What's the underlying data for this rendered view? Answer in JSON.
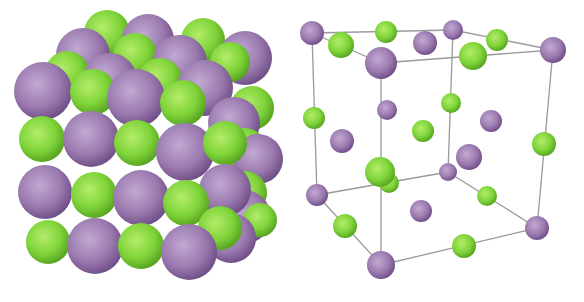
{
  "figure": {
    "panels": [
      {
        "id": "space-filling",
        "description": "Space-filling model of NaCl lattice"
      },
      {
        "id": "unit-cell",
        "description": "Ball-and-stick face-centered cubic unit cell"
      }
    ]
  },
  "colors": {
    "large_ion": "#9b7bb0",
    "large_ion_highlight": "#c2a9d2",
    "large_ion_shadow": "#6d4d85",
    "small_ion": "#7fd43a",
    "small_ion_highlight": "#b4ec6a",
    "small_ion_shadow": "#55a21f",
    "bond_line": "#9a9a9a",
    "background": "#ffffff"
  },
  "left_spheres": [
    {
      "x": 107,
      "y": 33,
      "r": 23,
      "c": "g"
    },
    {
      "x": 148,
      "y": 40,
      "r": 26,
      "c": "p"
    },
    {
      "x": 203,
      "y": 40,
      "r": 22,
      "c": "g"
    },
    {
      "x": 245,
      "y": 58,
      "r": 27,
      "c": "p"
    },
    {
      "x": 83,
      "y": 55,
      "r": 27,
      "c": "p"
    },
    {
      "x": 135,
      "y": 55,
      "r": 22,
      "c": "g"
    },
    {
      "x": 180,
      "y": 62,
      "r": 27,
      "c": "p"
    },
    {
      "x": 230,
      "y": 62,
      "r": 20,
      "c": "g"
    },
    {
      "x": 67,
      "y": 73,
      "r": 22,
      "c": "g"
    },
    {
      "x": 110,
      "y": 80,
      "r": 27,
      "c": "p"
    },
    {
      "x": 160,
      "y": 80,
      "r": 22,
      "c": "g"
    },
    {
      "x": 205,
      "y": 88,
      "r": 28,
      "c": "p"
    },
    {
      "x": 252,
      "y": 108,
      "r": 22,
      "c": "g"
    },
    {
      "x": 43,
      "y": 91,
      "r": 29,
      "c": "p"
    },
    {
      "x": 93,
      "y": 92,
      "r": 23,
      "c": "g"
    },
    {
      "x": 136,
      "y": 98,
      "r": 29,
      "c": "p"
    },
    {
      "x": 183,
      "y": 103,
      "r": 23,
      "c": "g"
    },
    {
      "x": 234,
      "y": 123,
      "r": 26,
      "c": "p"
    },
    {
      "x": 245,
      "y": 150,
      "r": 22,
      "c": "g"
    },
    {
      "x": 258,
      "y": 159,
      "r": 25,
      "c": "p"
    },
    {
      "x": 42,
      "y": 139,
      "r": 23,
      "c": "g"
    },
    {
      "x": 91,
      "y": 139,
      "r": 28,
      "c": "p"
    },
    {
      "x": 137,
      "y": 143,
      "r": 23,
      "c": "g"
    },
    {
      "x": 185,
      "y": 152,
      "r": 29,
      "c": "p"
    },
    {
      "x": 225,
      "y": 143,
      "r": 22,
      "c": "g"
    },
    {
      "x": 245,
      "y": 193,
      "r": 22,
      "c": "g"
    },
    {
      "x": 244,
      "y": 217,
      "r": 27,
      "c": "p"
    },
    {
      "x": 225,
      "y": 190,
      "r": 26,
      "c": "p"
    },
    {
      "x": 45,
      "y": 192,
      "r": 27,
      "c": "p"
    },
    {
      "x": 94,
      "y": 195,
      "r": 23,
      "c": "g"
    },
    {
      "x": 141,
      "y": 198,
      "r": 28,
      "c": "p"
    },
    {
      "x": 186,
      "y": 203,
      "r": 23,
      "c": "g"
    },
    {
      "x": 260,
      "y": 220,
      "r": 17,
      "c": "g"
    },
    {
      "x": 231,
      "y": 238,
      "r": 25,
      "c": "p"
    },
    {
      "x": 220,
      "y": 228,
      "r": 22,
      "c": "g"
    },
    {
      "x": 48,
      "y": 242,
      "r": 22,
      "c": "g"
    },
    {
      "x": 95,
      "y": 246,
      "r": 28,
      "c": "p"
    },
    {
      "x": 141,
      "y": 246,
      "r": 23,
      "c": "g"
    },
    {
      "x": 189,
      "y": 252,
      "r": 28,
      "c": "p"
    }
  ],
  "right_cell": {
    "edges": [
      [
        312,
        33,
        453,
        30
      ],
      [
        453,
        30,
        553,
        50
      ],
      [
        312,
        33,
        381,
        63
      ],
      [
        381,
        63,
        553,
        50
      ],
      [
        312,
        33,
        317,
        195
      ],
      [
        381,
        63,
        381,
        265
      ],
      [
        453,
        30,
        448,
        172
      ],
      [
        553,
        50,
        537,
        228
      ],
      [
        317,
        195,
        381,
        265
      ],
      [
        381,
        265,
        537,
        228
      ],
      [
        317,
        195,
        448,
        172
      ],
      [
        448,
        172,
        537,
        228
      ]
    ],
    "spheres": [
      {
        "x": 312,
        "y": 33,
        "r": 12,
        "c": "p"
      },
      {
        "x": 386,
        "y": 32,
        "r": 11,
        "c": "g"
      },
      {
        "x": 453,
        "y": 30,
        "r": 10,
        "c": "p"
      },
      {
        "x": 497,
        "y": 40,
        "r": 11,
        "c": "g"
      },
      {
        "x": 425,
        "y": 43,
        "r": 12,
        "c": "p"
      },
      {
        "x": 341,
        "y": 45,
        "r": 13,
        "c": "g"
      },
      {
        "x": 553,
        "y": 50,
        "r": 13,
        "c": "p"
      },
      {
        "x": 473,
        "y": 56,
        "r": 14,
        "c": "g"
      },
      {
        "x": 381,
        "y": 63,
        "r": 16,
        "c": "p"
      },
      {
        "x": 387,
        "y": 110,
        "r": 10,
        "c": "p"
      },
      {
        "x": 451,
        "y": 103,
        "r": 10,
        "c": "g"
      },
      {
        "x": 314,
        "y": 118,
        "r": 11,
        "c": "g"
      },
      {
        "x": 491,
        "y": 121,
        "r": 11,
        "c": "p"
      },
      {
        "x": 423,
        "y": 131,
        "r": 11,
        "c": "g"
      },
      {
        "x": 342,
        "y": 141,
        "r": 12,
        "c": "p"
      },
      {
        "x": 544,
        "y": 144,
        "r": 12,
        "c": "g"
      },
      {
        "x": 469,
        "y": 157,
        "r": 13,
        "c": "p"
      },
      {
        "x": 389,
        "y": 183,
        "r": 10,
        "c": "g"
      },
      {
        "x": 448,
        "y": 172,
        "r": 9,
        "c": "p"
      },
      {
        "x": 380,
        "y": 172,
        "r": 15,
        "c": "g"
      },
      {
        "x": 317,
        "y": 195,
        "r": 11,
        "c": "p"
      },
      {
        "x": 487,
        "y": 196,
        "r": 10,
        "c": "g"
      },
      {
        "x": 421,
        "y": 211,
        "r": 11,
        "c": "p"
      },
      {
        "x": 345,
        "y": 226,
        "r": 12,
        "c": "g"
      },
      {
        "x": 537,
        "y": 228,
        "r": 12,
        "c": "p"
      },
      {
        "x": 464,
        "y": 246,
        "r": 12,
        "c": "g"
      },
      {
        "x": 381,
        "y": 265,
        "r": 14,
        "c": "p"
      }
    ]
  }
}
